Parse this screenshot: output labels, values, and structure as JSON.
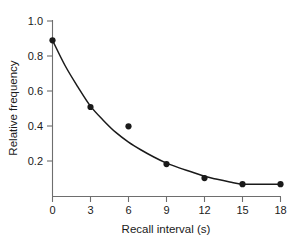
{
  "chart_data": {
    "type": "scatter",
    "title": "",
    "subtitle": "",
    "xlabel": "Recall interval (s)",
    "ylabel": "Relative frequency",
    "x": [
      0,
      3,
      6,
      9,
      12,
      15,
      18
    ],
    "values": [
      0.89,
      0.51,
      0.4,
      0.185,
      0.105,
      0.07,
      0.07
    ],
    "series": [
      {
        "name": "Observed relative frequency",
        "x": [
          0,
          3,
          6,
          9,
          12,
          15,
          18
        ],
        "values": [
          0.89,
          0.51,
          0.4,
          0.185,
          0.105,
          0.07,
          0.07
        ],
        "marker": "filled-circle",
        "color": "#1a1a1a"
      },
      {
        "name": "Fitted decay curve",
        "x": [
          0,
          1,
          2,
          3,
          4,
          5,
          6,
          7,
          8,
          9,
          10,
          11,
          12,
          13,
          14,
          15,
          16,
          17,
          18
        ],
        "values": [
          0.89,
          0.745,
          0.625,
          0.515,
          0.435,
          0.365,
          0.31,
          0.265,
          0.225,
          0.19,
          0.163,
          0.14,
          0.115,
          0.098,
          0.083,
          0.07,
          0.07,
          0.07,
          0.07
        ],
        "marker": "none",
        "color": "#1a1a1a"
      }
    ],
    "xlim": [
      0,
      18
    ],
    "ylim": [
      0,
      1.05
    ],
    "xticks": [
      0,
      3,
      6,
      9,
      12,
      15,
      18
    ],
    "xtick_labels": [
      "0",
      "3",
      "6",
      "9",
      "12",
      "15",
      "18"
    ],
    "yticks": [
      0.2,
      0.4,
      0.6,
      0.8,
      1.0
    ],
    "ytick_labels": [
      "0.2",
      "0.4",
      "0.6",
      "0.8",
      "1.0"
    ],
    "grid": false,
    "legend": "none",
    "annotations": []
  },
  "axes": {
    "x_title": "Recall interval (s)",
    "y_title": "Relative frequency",
    "x_tick_labels": [
      "0",
      "3",
      "6",
      "9",
      "12",
      "15",
      "18"
    ],
    "y_tick_labels": [
      "0.2",
      "0.4",
      "0.6",
      "0.8",
      "1.0"
    ]
  },
  "colors": {
    "axis": "#6e6e6e",
    "data": "#1a1a1a",
    "background": "#ffffff"
  }
}
